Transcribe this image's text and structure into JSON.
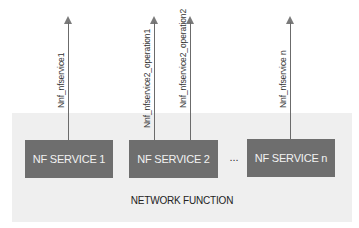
{
  "diagram": {
    "container": {
      "label": "NETWORK FUNCTION",
      "color": "#efefef"
    },
    "services": [
      {
        "label": "NF SERVICE 1"
      },
      {
        "label": "NF SERVICE 2"
      },
      {
        "label": "NF SERVICE n"
      }
    ],
    "ellipsis": "...",
    "interfaces": [
      {
        "label": "Nnf_nfservice1",
        "service": "NF SERVICE 1"
      },
      {
        "label": "Nnf_nfservice2_operation1",
        "service": "NF SERVICE 2"
      },
      {
        "label": "Nnf_nfservice2_operation2",
        "service": "NF SERVICE 2"
      },
      {
        "label": "Nnf_nfservice n",
        "service": "NF SERVICE n"
      }
    ],
    "colors": {
      "service_box": "#6e6e6e",
      "service_text": "#f2f2f2",
      "arrow": "#6b6b6b"
    }
  }
}
